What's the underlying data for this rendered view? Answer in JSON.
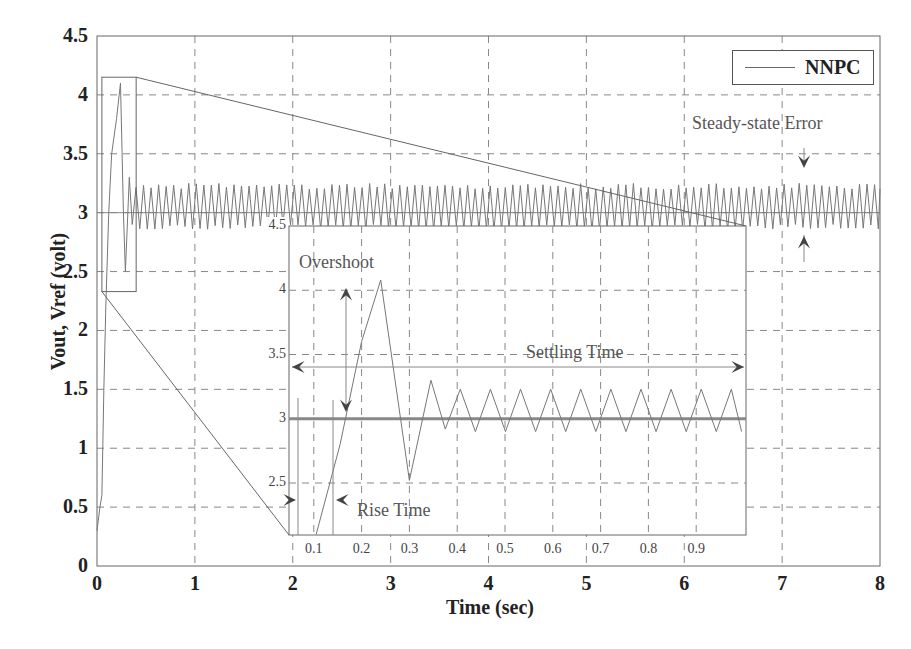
{
  "chart_data": [
    {
      "type": "line",
      "title": "",
      "xlabel": "Time (sec)",
      "ylabel": "Vout, Vref (volt)",
      "xlim": [
        0,
        8
      ],
      "ylim": [
        0,
        4.5
      ],
      "xticks": [
        "0",
        "1",
        "2",
        "3",
        "4",
        "5",
        "6",
        "7",
        "8"
      ],
      "yticks": [
        "0",
        "0.5",
        "1",
        "1.5",
        "2",
        "2.5",
        "3",
        "3.5",
        "4",
        "4.5"
      ],
      "grid": true,
      "grid_style": "dashed",
      "legend": {
        "position": "upper right",
        "entries": [
          "NNPC"
        ]
      },
      "series": [
        {
          "name": "NNPC",
          "description": "Output voltage: rises from ~0.3 V, overshoots to ~4.1 V near t=0.24 s, dips to ~2.5 V near t=0.3 s, then oscillates around 3 V (approx 2.85–3.25 V) until t=8 s",
          "x": [
            0,
            0.05,
            0.1,
            0.15,
            0.2,
            0.24,
            0.28,
            0.3,
            0.35,
            0.4,
            0.45,
            0.5,
            1,
            2,
            3,
            4,
            5,
            6,
            7,
            8
          ],
          "y": [
            0.3,
            0.6,
            2.2,
            3.0,
            3.7,
            4.1,
            3.0,
            2.5,
            3.3,
            2.9,
            3.2,
            2.9,
            3.0,
            3.0,
            3.0,
            3.0,
            3.0,
            3.0,
            3.0,
            3.0
          ],
          "steady_state_band": [
            2.85,
            3.25
          ]
        },
        {
          "name": "Vref",
          "description": "Reference voltage constant at 3 V",
          "x": [
            0,
            8
          ],
          "y": [
            3,
            3
          ]
        }
      ],
      "annotations": [
        {
          "text": "Steady-state Error",
          "x": 7.2,
          "y": 3.6
        }
      ],
      "zoom_box": {
        "x": [
          0.05,
          0.4
        ],
        "y": [
          2.33,
          4.15
        ]
      }
    },
    {
      "type": "line",
      "title": "Inset (zoomed 0–1 s)",
      "xlim": [
        0,
        1
      ],
      "ylim": [
        2.1,
        4.5
      ],
      "xticks": [
        "0.1",
        "0.2",
        "0.3",
        "0.4",
        "0.5",
        "0.6",
        "0.7",
        "0.8",
        "0.9"
      ],
      "yticks": [
        "2.5",
        "3",
        "3.5",
        "4",
        "4.5"
      ],
      "grid": true,
      "series": [
        {
          "name": "NNPC",
          "x": [
            0.05,
            0.1,
            0.15,
            0.2,
            0.24,
            0.28,
            0.3,
            0.35,
            0.38,
            0.4,
            0.43,
            0.45,
            0.48,
            0.5
          ],
          "y": [
            2.1,
            2.1,
            2.8,
            3.6,
            4.08,
            3.2,
            2.52,
            3.3,
            2.95,
            3.22,
            2.9,
            3.22,
            2.9,
            3.22
          ]
        },
        {
          "name": "Vref",
          "x": [
            0,
            1
          ],
          "y": [
            3,
            3
          ]
        }
      ],
      "annotations": [
        {
          "text": "Overshoot",
          "x": 0.12,
          "y": 4.27
        },
        {
          "text": "Settling Time",
          "x": 0.55,
          "y": 3.45
        },
        {
          "text": "Rise Time",
          "x": 0.15,
          "y": 2.3
        }
      ]
    }
  ],
  "labels": {
    "xlabel": "Time (sec)",
    "ylabel": "Vout, Vref (volt)",
    "legend": "NNPC",
    "steady_state": "Steady-state Error",
    "overshoot": "Overshoot",
    "settling": "Settling Time",
    "rise": "Rise Time"
  },
  "colors": {
    "signal": "#777777",
    "reference": "#888888",
    "grid": "#888888",
    "axis": "#666666",
    "arrow": "#444444"
  }
}
